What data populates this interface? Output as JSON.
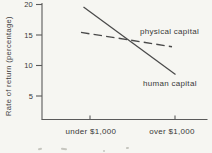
{
  "chart_data": {
    "type": "line",
    "title": "",
    "ylabel": "Rate of return (percentage)",
    "xlabel": "",
    "categories": [
      "under $1,000",
      "over $1,000"
    ],
    "y_ticks": [
      20,
      15,
      10,
      5
    ],
    "ylim": [
      1,
      21
    ],
    "grid": false,
    "legend_position": "inline-labels-on-plot",
    "series": [
      {
        "name": "physical capital",
        "style": "dashed",
        "values": [
          15.2,
          13.0
        ]
      },
      {
        "name": "human capital",
        "style": "solid",
        "values": [
          18.8,
          8.6
        ]
      }
    ],
    "colors": {
      "line": "#4a4a4a",
      "axis": "#5a5a5a",
      "text": "#3c3c3c",
      "background": "#f6f6f2"
    }
  }
}
